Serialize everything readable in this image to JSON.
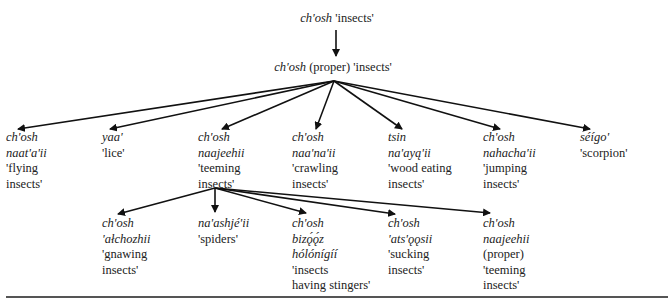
{
  "diagram": {
    "type": "taxonomy-tree",
    "root": {
      "term": "ch'osh",
      "gloss": "'insects'"
    },
    "level1": {
      "term": "ch'osh",
      "qualifier": "(proper)",
      "gloss": "'insects'"
    },
    "children": [
      {
        "lines": [
          "ch'osh",
          "naat'a'ii"
        ],
        "gloss": [
          "'flying",
          "insects'"
        ]
      },
      {
        "lines": [
          "yaa'"
        ],
        "gloss": [
          "'lice'"
        ]
      },
      {
        "lines": [
          "ch'osh",
          "naajeehii"
        ],
        "gloss": [
          "'teeming",
          "insects'"
        ]
      },
      {
        "lines": [
          "ch'osh",
          "naa'na'ii"
        ],
        "gloss": [
          "'crawling",
          "insects'"
        ]
      },
      {
        "lines": [
          "tsin",
          "na'ayą'ii"
        ],
        "gloss": [
          "'wood eating",
          "insects'"
        ]
      },
      {
        "lines": [
          "ch'osh",
          "nahacha'ii"
        ],
        "gloss": [
          "'jumping",
          "insects'"
        ]
      },
      {
        "lines": [
          "séígo'"
        ],
        "gloss": [
          "'scorpion'"
        ]
      }
    ],
    "teeming_children": [
      {
        "lines": [
          "ch'osh",
          "'ałchozhii"
        ],
        "gloss": [
          "'gnawing",
          "insects'"
        ]
      },
      {
        "lines": [
          "na'ashjé'ii"
        ],
        "gloss": [
          "'spiders'"
        ]
      },
      {
        "lines": [
          "ch'osh",
          "bizǫ́ǫ́z",
          "hólónígíí"
        ],
        "gloss": [
          "'insects",
          "having stingers'"
        ]
      },
      {
        "lines": [
          "ch'osh",
          "'ats'ǫǫsii"
        ],
        "gloss": [
          "'sucking",
          "insects'"
        ]
      },
      {
        "lines": [
          "ch'osh",
          "naajeehii"
        ],
        "qualifier": "(proper)",
        "gloss": [
          "'teeming",
          "insects'"
        ]
      }
    ]
  }
}
